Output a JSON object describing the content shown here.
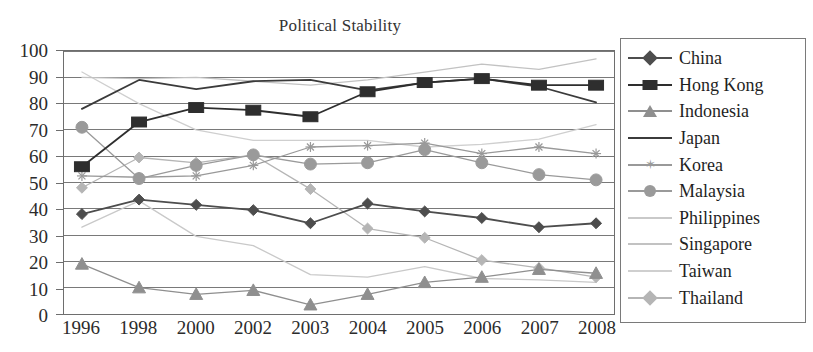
{
  "chart_data": {
    "type": "line",
    "title": "Political Stability",
    "xlabel": "",
    "ylabel": "",
    "ylim": [
      0,
      100
    ],
    "ytick_step": 10,
    "yticks": [
      "100",
      "90",
      "80",
      "70",
      "60",
      "50",
      "40",
      "30",
      "20",
      "10",
      "0"
    ],
    "grid": "horizontal",
    "legend_position": "right",
    "categories": [
      "1996",
      "1998",
      "2000",
      "2002",
      "2003",
      "2004",
      "2005",
      "2006",
      "2007",
      "2008"
    ],
    "series": [
      {
        "name": "China",
        "marker": "diamond",
        "color": "#4d4d4d",
        "values": [
          38,
          43.5,
          41.5,
          39.5,
          34.5,
          42,
          39,
          36.5,
          33,
          34.5
        ]
      },
      {
        "name": "Hong Kong",
        "marker": "square",
        "color": "#2e2e2e",
        "values": [
          56,
          73,
          78.5,
          77.5,
          75,
          84.5,
          88,
          89.5,
          87,
          87
        ]
      },
      {
        "name": "Indonesia",
        "marker": "triangle",
        "color": "#8f8f8f",
        "values": [
          19,
          10,
          7.5,
          9,
          3.5,
          7.5,
          12,
          14,
          17,
          15.5
        ]
      },
      {
        "name": "Japan",
        "marker": "none",
        "color": "#3b3b3b",
        "values": [
          78,
          89,
          85.5,
          88.5,
          89,
          85,
          88,
          89.5,
          86.5,
          80.5
        ]
      },
      {
        "name": "Korea",
        "marker": "star",
        "color": "#999999",
        "values": [
          52.5,
          52,
          52.5,
          56.5,
          63.5,
          64,
          65,
          61,
          63.5,
          61
        ]
      },
      {
        "name": "Malaysia",
        "marker": "circle",
        "color": "#9a9a9a",
        "values": [
          71,
          51.5,
          56.5,
          60.5,
          57,
          57.5,
          62.5,
          57.5,
          53,
          51
        ]
      },
      {
        "name": "Philippines",
        "marker": "none",
        "color": "#c9c9c9",
        "values": [
          33,
          43,
          29.5,
          26,
          15,
          14,
          18,
          13.5,
          13,
          12
        ]
      },
      {
        "name": "Singapore",
        "marker": "none",
        "color": "#c2c2c2",
        "values": [
          90,
          89.5,
          90,
          88.5,
          87,
          89,
          92,
          95,
          93,
          97
        ]
      },
      {
        "name": "Taiwan",
        "marker": "none",
        "color": "#cfcfcf",
        "values": [
          92,
          80,
          70,
          66,
          66,
          66,
          63.5,
          64.5,
          66.5,
          72
        ]
      },
      {
        "name": "Thailand",
        "marker": "diamond-light",
        "color": "#b5b5b5",
        "values": [
          48,
          59.5,
          57.5,
          60.5,
          47.5,
          32.5,
          29,
          20.5,
          17.5,
          14
        ]
      }
    ]
  },
  "legend": {
    "items": [
      {
        "label": "China"
      },
      {
        "label": "Hong Kong"
      },
      {
        "label": "Indonesia"
      },
      {
        "label": "Japan"
      },
      {
        "label": "Korea"
      },
      {
        "label": "Malaysia"
      },
      {
        "label": "Philippines"
      },
      {
        "label": "Singapore"
      },
      {
        "label": "Taiwan"
      },
      {
        "label": "Thailand"
      }
    ]
  },
  "colors": {
    "axis": "#6e6e6e",
    "gridline": "#787878",
    "plot_border": "#6e6e6e",
    "legend_border": "#7a7a7a",
    "title": "#333333",
    "tick_text": "#2b2b2b"
  }
}
